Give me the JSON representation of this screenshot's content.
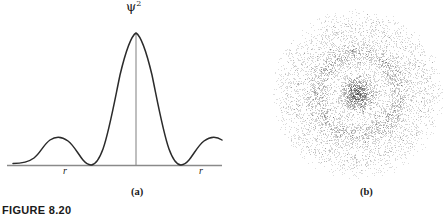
{
  "figure": {
    "number_label": "FIGURE 8.20",
    "panels": [
      {
        "id": "a",
        "caption": "(a)"
      },
      {
        "id": "b",
        "caption": "(b)"
      }
    ]
  },
  "panel_a": {
    "y_axis_label": "ψ",
    "y_axis_exponent": "2",
    "x_tick_labels": [
      "r",
      "r"
    ],
    "caption": "(a)",
    "curve_color": "#2b2b2b",
    "axis_color": "#8a8a8a"
  },
  "panel_b": {
    "caption": "(b)",
    "dot_color": "#4a4a4a",
    "description": "radial-electron-probability-dot-cloud"
  },
  "chart_data": {
    "type": "line",
    "title": "",
    "xlabel": "r",
    "ylabel": "ψ²",
    "grid": false,
    "legend": null,
    "xlim": [
      0,
      1
    ],
    "ylim": [
      0,
      1
    ],
    "series": [
      {
        "name": "psi-squared-radial-distribution",
        "x": [
          0.0,
          0.03,
          0.06,
          0.09,
          0.12,
          0.16,
          0.2,
          0.24,
          0.28,
          0.32,
          0.36,
          0.4,
          0.44,
          0.47,
          0.5,
          0.53,
          0.56,
          0.6,
          0.64,
          0.68,
          0.72,
          0.76,
          0.8,
          0.84,
          0.88,
          0.92,
          0.96,
          1.0
        ],
        "y": [
          0.03,
          0.03,
          0.05,
          0.11,
          0.18,
          0.19,
          0.13,
          0.04,
          0.01,
          0.08,
          0.3,
          0.64,
          0.9,
          0.99,
          1.0,
          0.99,
          0.9,
          0.64,
          0.3,
          0.08,
          0.01,
          0.04,
          0.13,
          0.19,
          0.18,
          0.11,
          0.05,
          0.03
        ]
      }
    ],
    "annotations": [
      {
        "text": "r",
        "x": 0.27,
        "y": -0.05
      },
      {
        "text": "r",
        "x": 0.91,
        "y": -0.05
      }
    ]
  }
}
